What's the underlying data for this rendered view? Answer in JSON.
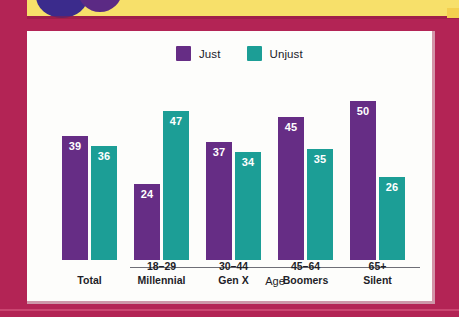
{
  "legend": {
    "items": [
      {
        "label": "Just",
        "color": "#662d85",
        "icon": "legend-swatch-icon"
      },
      {
        "label": "Unjust",
        "color": "#1c9e96",
        "icon": "legend-swatch-icon"
      }
    ]
  },
  "axis": {
    "group_label": "Age"
  },
  "decor": {
    "band_color": "#f7e06a",
    "frame_color": "#b32455",
    "circle_color": "#3b2b8c"
  },
  "chart_data": {
    "type": "bar",
    "title": "",
    "subtitle": "",
    "xlabel": "Age",
    "ylabel": "",
    "ylim": [
      0,
      50
    ],
    "grid": false,
    "legend_position": "top-center",
    "categories": [
      "Total",
      "18–29 Millennial",
      "30–44 Gen X",
      "45–64 Boomers",
      "65+ Silent"
    ],
    "category_lines": [
      {
        "line1": "Total",
        "line2": ""
      },
      {
        "line1": "18–29",
        "line2": "Millennial"
      },
      {
        "line1": "30–44",
        "line2": "Gen X"
      },
      {
        "line1": "45–64",
        "line2": "Boomers"
      },
      {
        "line1": "65+",
        "line2": "Silent"
      }
    ],
    "series": [
      {
        "name": "Just",
        "color": "#662d85",
        "values": [
          39,
          24,
          37,
          45,
          50
        ]
      },
      {
        "name": "Unjust",
        "color": "#1c9e96",
        "values": [
          36,
          47,
          34,
          35,
          26
        ]
      }
    ],
    "labels": {
      "just": [
        "39",
        "24",
        "37",
        "45",
        "50"
      ],
      "unjust": [
        "36",
        "47",
        "34",
        "35",
        "26"
      ]
    }
  }
}
